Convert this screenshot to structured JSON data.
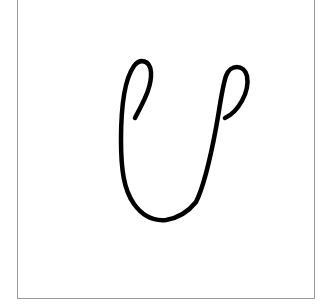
{
  "figure": {
    "letter": "U",
    "stroke_color": "#000000",
    "border_color": "#9a9a9a",
    "background_color": "#ffffff"
  }
}
